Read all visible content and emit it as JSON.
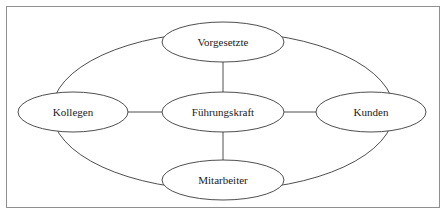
{
  "diagram": {
    "type": "relationship-network",
    "title_visible": false,
    "background_color": "#ffffff",
    "border_color": "#8f8f8f",
    "stroke_color": "#3a3a3a",
    "text_color": "#1a1a1a",
    "nodes": [
      {
        "id": "fuehrungskraft",
        "label": "Führungskraft",
        "role": "center",
        "cx": 223,
        "cy": 112,
        "rx": 61,
        "ry": 20
      },
      {
        "id": "vorgesetzte",
        "label": "Vorgesetzte",
        "role": "top",
        "cx": 223,
        "cy": 42,
        "rx": 61,
        "ry": 20
      },
      {
        "id": "kollegen",
        "label": "Kollegen",
        "role": "left",
        "cx": 73,
        "cy": 112,
        "rx": 55,
        "ry": 20
      },
      {
        "id": "kunden",
        "label": "Kunden",
        "role": "right",
        "cx": 371,
        "cy": 112,
        "rx": 55,
        "ry": 20
      },
      {
        "id": "mitarbeiter",
        "label": "Mitarbeiter",
        "role": "bottom",
        "cx": 223,
        "cy": 180,
        "rx": 61,
        "ry": 20
      }
    ],
    "edges": [
      {
        "id": "edge-center-top",
        "from": "fuehrungskraft",
        "to": "vorgesetzte",
        "x1": 223,
        "y1": 92,
        "x2": 223,
        "y2": 62
      },
      {
        "id": "edge-center-bottom",
        "from": "fuehrungskraft",
        "to": "mitarbeiter",
        "x1": 223,
        "y1": 132,
        "x2": 223,
        "y2": 160
      },
      {
        "id": "edge-center-left",
        "from": "fuehrungskraft",
        "to": "kollegen",
        "x1": 162,
        "y1": 112,
        "x2": 128,
        "y2": 112
      },
      {
        "id": "edge-center-right",
        "from": "fuehrungskraft",
        "to": "kunden",
        "x1": 284,
        "y1": 112,
        "x2": 316,
        "y2": 112
      }
    ],
    "outer_ring": {
      "id": "outer-ring",
      "description": "large ellipse passing through the four outer nodes",
      "cx": 223,
      "cy": 111,
      "rx": 171,
      "ry": 79
    }
  }
}
